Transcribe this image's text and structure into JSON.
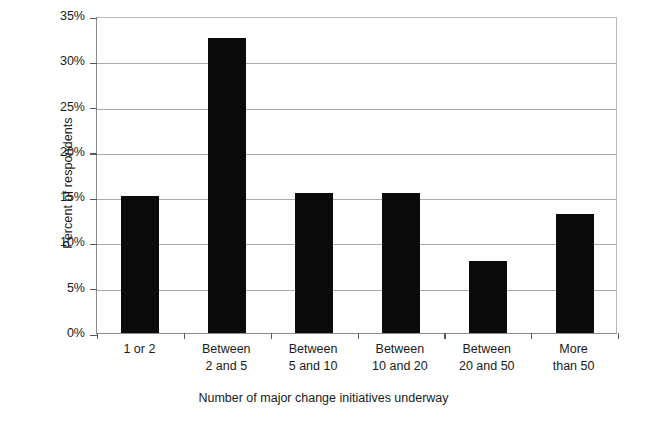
{
  "chart_data": {
    "type": "bar",
    "title": "",
    "subtitle": "",
    "xlabel": "Number of major change initiatives underway",
    "ylabel": "Percent of respondents",
    "categories": [
      "1 or 2",
      "Between 2 and 5",
      "Between 5 and 10",
      "Between 10 and 20",
      "Between 20 and 50",
      "More than 50"
    ],
    "category_lines": [
      [
        "1 or 2"
      ],
      [
        "Between",
        "2 and 5"
      ],
      [
        "Between",
        "5 and 10"
      ],
      [
        "Between",
        "10 and 20"
      ],
      [
        "Between",
        "20 and 50"
      ],
      [
        "More",
        "than 50"
      ]
    ],
    "values": [
      15.1,
      32.6,
      15.5,
      15.5,
      8.0,
      13.1
    ],
    "ylim": [
      0,
      35
    ],
    "ytick_values": [
      0,
      5,
      10,
      15,
      20,
      25,
      30,
      35
    ],
    "ytick_labels": [
      "0%",
      "5%",
      "10%",
      "15%",
      "20%",
      "25%",
      "30%",
      "35%"
    ],
    "grid": true,
    "grid_axis": "y",
    "legend": false,
    "legend_position": "none",
    "bar_color": "#0b0b0b",
    "plot_background": "#ffffff",
    "gridline_color": "#a9a9a9",
    "axis_color": "#8b8b8b"
  }
}
